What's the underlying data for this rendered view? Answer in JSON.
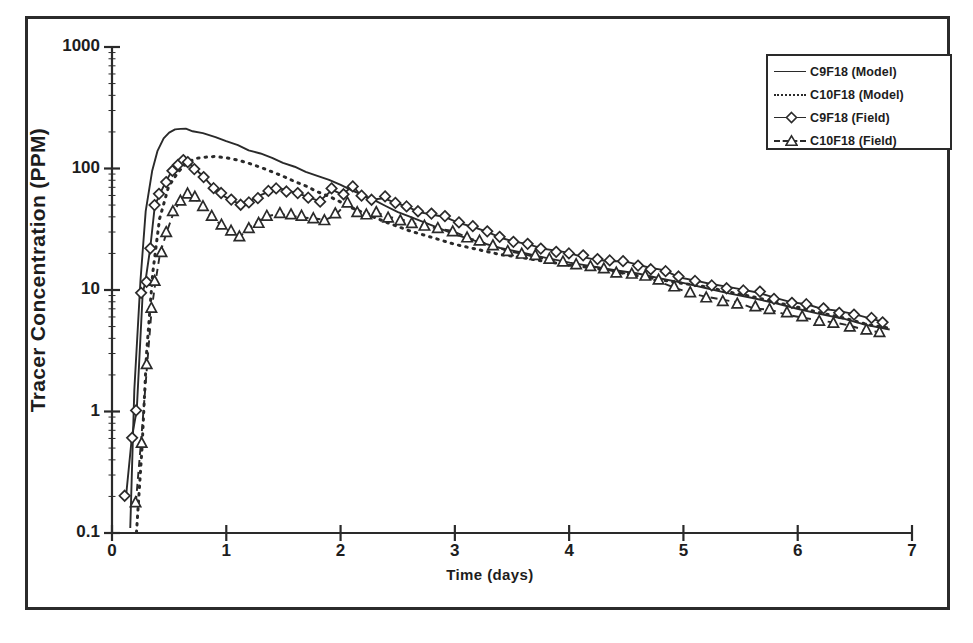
{
  "figure": {
    "background": "#ffffff",
    "ink_color": "#2a2a2a",
    "border": true
  },
  "axes": {
    "y_title": "Tracer Concentration (PPM)",
    "x_title": "Time (days)",
    "y_ticks": [
      "1000",
      "100",
      "10",
      "1",
      "0.1"
    ],
    "x_ticks": [
      "0",
      "1",
      "2",
      "3",
      "4",
      "5",
      "6",
      "7"
    ]
  },
  "legend": {
    "position": "top-right",
    "entries": [
      {
        "label": "C9F18 (Model)",
        "key": "solid-line",
        "marker": "none"
      },
      {
        "label": "C10F18 (Model)",
        "key": "dotted-line",
        "marker": "none"
      },
      {
        "label": "C9F18 (Field)",
        "key": "solid-line-marker",
        "marker": "diamond"
      },
      {
        "label": "C10F18 (Field)",
        "key": "dashed-line-marker",
        "marker": "triangle"
      }
    ]
  },
  "chart_data": {
    "type": "line",
    "title": "",
    "xlabel": "Time (days)",
    "ylabel": "Tracer Concentration (PPM)",
    "xlim": [
      0,
      7
    ],
    "ylim": [
      0.1,
      1000
    ],
    "yscale": "log",
    "xscale": "linear",
    "grid": false,
    "legend_position": "top-right",
    "series": [
      {
        "name": "C9F18 (Model)",
        "style": "solid",
        "marker": "none",
        "x": [
          0.16,
          0.2,
          0.25,
          0.3,
          0.35,
          0.4,
          0.45,
          0.5,
          0.55,
          0.6,
          0.65,
          0.7,
          0.8,
          0.9,
          1.0,
          1.1,
          1.2,
          1.3,
          1.4,
          1.5,
          1.6,
          1.7,
          1.8,
          1.9,
          2.0,
          2.1,
          2.2,
          2.3,
          2.4,
          2.5,
          2.6,
          2.8,
          3.0,
          3.2,
          3.4,
          3.6,
          3.8,
          4.0,
          4.2,
          4.4,
          4.6,
          4.8,
          5.0,
          5.2,
          5.4,
          5.6,
          5.8,
          6.0,
          6.2,
          6.4,
          6.6,
          6.8
        ],
        "y": [
          0.11,
          1.5,
          12,
          45,
          95,
          140,
          175,
          196,
          208,
          212,
          210,
          205,
          195,
          180,
          168,
          155,
          143,
          132,
          122,
          112,
          103,
          95,
          88,
          80,
          73,
          66,
          60,
          54,
          49,
          44,
          40,
          34,
          29,
          25,
          22,
          20,
          18.5,
          17,
          15.8,
          14.6,
          13.5,
          12.4,
          11.4,
          10.4,
          9.5,
          8.6,
          7.8,
          7.1,
          6.4,
          5.8,
          5.2,
          4.7
        ]
      },
      {
        "name": "C10F18 (Model)",
        "style": "dotted",
        "marker": "none",
        "x": [
          0.22,
          0.26,
          0.3,
          0.36,
          0.42,
          0.5,
          0.58,
          0.66,
          0.74,
          0.82,
          0.9,
          1.0,
          1.1,
          1.2,
          1.3,
          1.4,
          1.5,
          1.6,
          1.7,
          1.8,
          1.9,
          2.0,
          2.1,
          2.2,
          2.4,
          2.6,
          2.8,
          3.0,
          3.2,
          3.4,
          3.6,
          3.8,
          4.0,
          4.2,
          4.4,
          4.6,
          4.8,
          5.0,
          5.2,
          5.4,
          5.6,
          5.8,
          6.0,
          6.2,
          6.4,
          6.6,
          6.8
        ],
        "y": [
          0.1,
          0.5,
          3,
          14,
          38,
          70,
          95,
          112,
          120,
          124,
          125,
          122,
          116,
          109,
          101,
          93,
          86,
          79,
          72,
          65,
          59,
          53,
          48,
          43,
          36,
          31,
          27,
          24,
          21.5,
          19.8,
          18.4,
          17.2,
          16.2,
          15.2,
          14.2,
          13.2,
          12.3,
          11.4,
          10.5,
          9.6,
          8.8,
          8.0,
          7.2,
          6.5,
          5.9,
          5.3,
          4.8
        ]
      },
      {
        "name": "C9F18 (Field)",
        "style": "solid",
        "marker": "diamond",
        "x": [
          0.12,
          0.18,
          0.22,
          0.26,
          0.3,
          0.34,
          0.38,
          0.42,
          0.47,
          0.52,
          0.57,
          0.62,
          0.67,
          0.72,
          0.8,
          0.88,
          0.96,
          1.04,
          1.12,
          1.2,
          1.28,
          1.36,
          1.44,
          1.52,
          1.62,
          1.72,
          1.82,
          1.92,
          2.02,
          2.1,
          2.18,
          2.28,
          2.38,
          2.48,
          2.58,
          2.68,
          2.8,
          2.92,
          3.04,
          3.16,
          3.28,
          3.4,
          3.52,
          3.64,
          3.76,
          3.88,
          4.0,
          4.12,
          4.24,
          4.36,
          4.48,
          4.6,
          4.72,
          4.84,
          4.96,
          5.1,
          5.24,
          5.38,
          5.52,
          5.66,
          5.8,
          5.94,
          6.08,
          6.22,
          6.36,
          6.5,
          6.64,
          6.75
        ],
        "y": [
          0.2,
          0.62,
          1.0,
          9.5,
          11.5,
          22,
          50,
          62,
          78,
          95,
          108,
          115,
          112,
          100,
          86,
          70,
          62,
          55,
          50,
          52,
          58,
          64,
          68,
          66,
          62,
          58,
          54,
          68,
          62,
          72,
          60,
          56,
          58,
          52,
          48,
          44,
          42,
          40,
          36,
          33,
          30,
          27,
          25,
          24,
          22,
          21,
          20,
          19,
          18,
          17.5,
          17,
          16,
          15,
          14.5,
          13,
          12,
          11,
          10.5,
          10,
          9.5,
          8.5,
          8,
          7.5,
          7,
          6.6,
          6.2,
          5.8,
          5.5
        ]
      },
      {
        "name": "C10F18 (Field)",
        "style": "dashed",
        "marker": "triangle",
        "x": [
          0.2,
          0.26,
          0.3,
          0.34,
          0.38,
          0.43,
          0.48,
          0.54,
          0.6,
          0.66,
          0.72,
          0.8,
          0.88,
          0.96,
          1.04,
          1.12,
          1.2,
          1.28,
          1.36,
          1.46,
          1.56,
          1.66,
          1.76,
          1.86,
          1.96,
          2.06,
          2.14,
          2.22,
          2.32,
          2.42,
          2.52,
          2.62,
          2.74,
          2.86,
          2.98,
          3.1,
          3.22,
          3.34,
          3.46,
          3.58,
          3.7,
          3.82,
          3.94,
          4.06,
          4.18,
          4.3,
          4.42,
          4.54,
          4.66,
          4.78,
          4.92,
          5.06,
          5.2,
          5.34,
          5.48,
          5.62,
          5.76,
          5.9,
          6.04,
          6.18,
          6.32,
          6.46,
          6.6,
          6.72
        ],
        "y": [
          0.18,
          0.55,
          2.4,
          7.0,
          12,
          20,
          30,
          44,
          55,
          62,
          58,
          48,
          40,
          34,
          30,
          28,
          32,
          36,
          40,
          42,
          41,
          40,
          39,
          38,
          42,
          52,
          44,
          42,
          44,
          40,
          38,
          36,
          34,
          32,
          30,
          27,
          25,
          23,
          21,
          20,
          19,
          18,
          17,
          16,
          15.5,
          15,
          14,
          13.5,
          13,
          12,
          10.5,
          9.5,
          8.8,
          8.2,
          7.8,
          7.2,
          6.8,
          6.4,
          6.0,
          5.6,
          5.3,
          5.0,
          4.7,
          4.4
        ]
      }
    ]
  }
}
